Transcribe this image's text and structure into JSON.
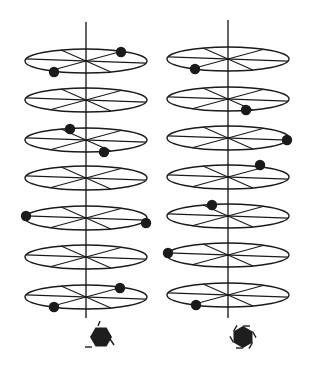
{
  "figure": {
    "colors": {
      "ink": "#1a1a1a",
      "background": "#ffffff"
    },
    "disk_geometry": {
      "rx": 61,
      "ry": 12
    },
    "columns": [
      {
        "id": "left",
        "axis_x": 86,
        "axis_top": 22,
        "axis_bottom": 318,
        "disks": [
          {
            "cy": 61,
            "dots": [
              [
                121,
                52
              ],
              [
                54,
                72
              ]
            ]
          },
          {
            "cy": 100,
            "dots": []
          },
          {
            "cy": 140,
            "dots": [
              [
                70,
                129
              ],
              [
                104,
                152
              ]
            ]
          },
          {
            "cy": 178,
            "dots": []
          },
          {
            "cy": 218,
            "dots": [
              [
                26,
                216
              ],
              [
                146,
                223
              ]
            ]
          },
          {
            "cy": 257,
            "dots": []
          },
          {
            "cy": 297,
            "dots": [
              [
                120,
                288
              ],
              [
                54,
                307
              ]
            ]
          }
        ],
        "marker": {
          "type": "hexagon",
          "cx": 101,
          "cy": 337,
          "variant": "stationary"
        }
      },
      {
        "id": "right",
        "axis_x": 228,
        "axis_top": 20,
        "axis_bottom": 318,
        "disks": [
          {
            "cy": 59,
            "dots": [
              [
                195,
                69
              ]
            ]
          },
          {
            "cy": 99,
            "dots": [
              [
                246,
                110
              ]
            ]
          },
          {
            "cy": 138,
            "dots": [
              [
                287,
                140
              ]
            ]
          },
          {
            "cy": 177,
            "dots": [
              [
                260,
                165
              ]
            ]
          },
          {
            "cy": 216,
            "dots": [
              [
                212,
                205
              ]
            ]
          },
          {
            "cy": 255,
            "dots": [
              [
                168,
                253
              ]
            ]
          },
          {
            "cy": 295,
            "dots": [
              [
                196,
                305
              ]
            ]
          }
        ],
        "marker": {
          "type": "hexagon",
          "cx": 243,
          "cy": 337,
          "variant": "rotating"
        }
      }
    ]
  }
}
